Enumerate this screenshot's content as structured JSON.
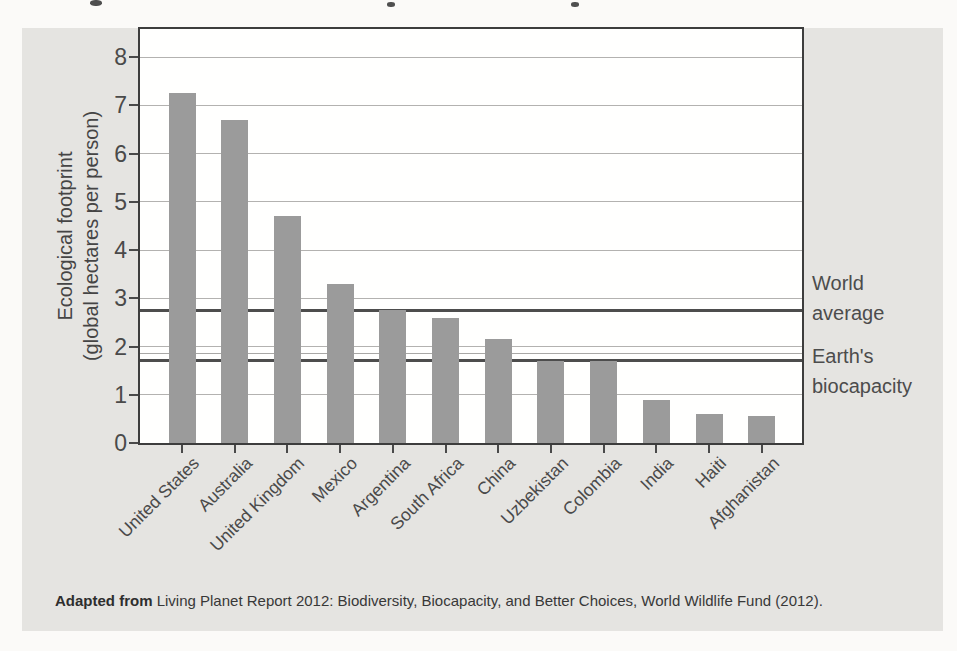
{
  "figure": {
    "panel_color": "#e5e4e1",
    "page_color": "#fbfaf8",
    "bar_color": "#9b9b9b",
    "ylabel_line1": "Ecological footprint",
    "ylabel_line2": "(global hectares per person)",
    "annotations": {
      "world_average": {
        "line1": "World",
        "line2": "average",
        "value": 2.75
      },
      "earths_biocapacity": {
        "line1": "Earth's",
        "line2": "biocapacity",
        "value": 1.7
      }
    },
    "caption": {
      "bold_prefix": "Adapted from",
      "text": " Living Planet Report 2012: Biodiversity, Biocapacity, and Better Choices, World Wildlife Fund (2012)."
    }
  },
  "chart_data": {
    "type": "bar",
    "categories": [
      "United States",
      "Australia",
      "United Kingdom",
      "Mexico",
      "Argentina",
      "South Africa",
      "China",
      "Uzbekistan",
      "Colombia",
      "India",
      "Haiti",
      "Afghanistan"
    ],
    "values": [
      7.25,
      6.7,
      4.7,
      3.3,
      2.75,
      2.6,
      2.15,
      1.7,
      1.7,
      0.9,
      0.6,
      0.55
    ],
    "title": "",
    "xlabel": "",
    "ylabel": "Ecological footprint (global hectares per person)",
    "ylim": [
      0,
      8.55
    ],
    "yticks": [
      0,
      1,
      2,
      3,
      4,
      5,
      6,
      7,
      8
    ],
    "grid": true,
    "legend_position": "none",
    "reference_lines": [
      {
        "label": "World average",
        "value": 2.75
      },
      {
        "label": "Earth's biocapacity",
        "value": 1.7
      }
    ],
    "source": "Adapted from Living Planet Report 2012: Biodiversity, Biocapacity, and Better Choices, World Wildlife Fund (2012)."
  }
}
